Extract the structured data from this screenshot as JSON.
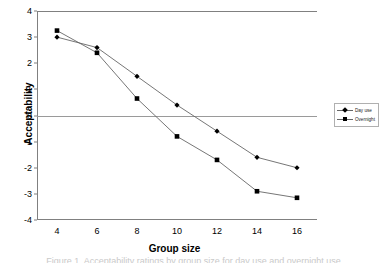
{
  "chart_data": {
    "type": "line",
    "title": "",
    "xlabel": "Group size",
    "ylabel": "Acceptability",
    "x": [
      4,
      6,
      8,
      10,
      12,
      14,
      16
    ],
    "xticks": [
      "4",
      "6",
      "8",
      "10",
      "12",
      "14",
      "16"
    ],
    "yticks": [
      "4",
      "3",
      "2",
      "1",
      "0",
      "-1",
      "-2",
      "-3",
      "-4"
    ],
    "xlim": [
      3,
      17
    ],
    "ylim": [
      -4,
      4
    ],
    "grid": false,
    "zero_reference_line": true,
    "legend_position": "right-outside",
    "series": [
      {
        "name": "Day use",
        "marker": "diamond",
        "values": [
          3.0,
          2.6,
          1.5,
          0.4,
          -0.6,
          -1.6,
          -2.0
        ]
      },
      {
        "name": "Overnight",
        "marker": "square",
        "values": [
          3.25,
          2.4,
          0.65,
          -0.8,
          -1.7,
          -2.9,
          -3.15
        ]
      }
    ],
    "colors": {
      "line": "#666666",
      "marker": "#000000",
      "axis": "#808080",
      "zero_line": "#9a9a9a",
      "background": "#ffffff"
    }
  },
  "caption": "Figure 1. Acceptability ratings by group size for day use and overnight use"
}
